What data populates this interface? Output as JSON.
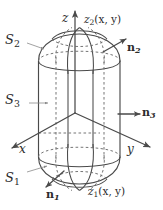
{
  "figure": {
    "type": "3d-geometry-diagram",
    "background_color": "#ffffff",
    "line_color": "#4a4a4a",
    "hidden_line_color": "#6e6e6e",
    "label_color": "#2b2b2b"
  },
  "axes": {
    "z": {
      "label": "z",
      "direction": "up"
    },
    "x": {
      "label": "x",
      "direction": "down-left"
    },
    "y": {
      "label": "y",
      "direction": "down-right"
    }
  },
  "surfaces": [
    {
      "id": "S2",
      "base": "S",
      "sub": "2",
      "label": "S",
      "role": "top cap surface"
    },
    {
      "id": "S3",
      "base": "S",
      "sub": "3",
      "label": "S",
      "role": "lateral cylinder surface"
    },
    {
      "id": "S1",
      "base": "S",
      "sub": "1",
      "label": "S",
      "role": "bottom cap surface"
    }
  ],
  "normals": [
    {
      "id": "n2",
      "base": "n",
      "sub": "2",
      "label": "n",
      "role": "outward normal on top cap",
      "direction": "up-right"
    },
    {
      "id": "n3",
      "base": "n",
      "sub": "3",
      "label": "n",
      "role": "outward normal on lateral surface",
      "direction": "right"
    },
    {
      "id": "n1",
      "base": "n",
      "sub": "1",
      "label": "n",
      "role": "outward normal on bottom cap",
      "direction": "down-left"
    }
  ],
  "functions": [
    {
      "id": "z2",
      "base": "z",
      "sub": "2",
      "args": "(x, y)",
      "role": "upper surface height function"
    },
    {
      "id": "z1",
      "base": "z",
      "sub": "1",
      "args": "(x, y)",
      "role": "lower surface height function"
    }
  ]
}
